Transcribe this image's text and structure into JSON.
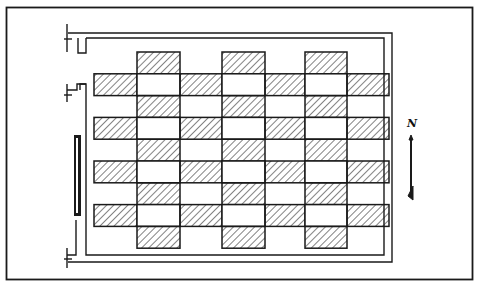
{
  "diagram": {
    "type": "site-plan",
    "north_label": "N",
    "colors": {
      "ink": "#1a1a1a",
      "paper": "#ffffff"
    },
    "grid": {
      "origin_x": 94,
      "origin_y": 52,
      "col_widths": [
        43,
        43,
        42,
        43,
        40,
        42,
        42
      ],
      "row_height": 21.8,
      "rows": 9,
      "cols": 7,
      "hatched_columns": [
        1,
        3,
        5
      ],
      "hatched_band_rows": [
        1,
        3,
        5,
        7
      ]
    }
  }
}
